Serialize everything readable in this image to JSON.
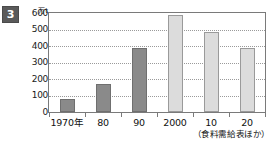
{
  "badge": {
    "number": "3"
  },
  "chart_data": {
    "type": "bar",
    "title": "",
    "subtitle": "",
    "xlabel": "",
    "ylabel": "万t",
    "unit_label": "万t",
    "categories": [
      "1970年",
      "80",
      "90",
      "2000",
      "10",
      "20"
    ],
    "values": [
      80,
      170,
      385,
      590,
      485,
      390
    ],
    "series": [
      {
        "name": "生産量",
        "values": [
          80,
          170,
          385,
          590,
          485,
          390
        ],
        "bar_styles": [
          "dark",
          "dark",
          "dark",
          "light",
          "light",
          "light"
        ]
      }
    ],
    "ylim": [
      0,
      600
    ],
    "ytick_values": [
      0,
      100,
      200,
      300,
      400,
      500,
      600
    ],
    "ytick_labels": [
      "0",
      "100",
      "200",
      "300",
      "400",
      "500",
      "600"
    ],
    "grid": true,
    "grid_style": "dotted-horizontal",
    "legend": false,
    "legend_position": "none",
    "source_note": "（食料需給表ほか）",
    "colors": {
      "bar_dark_fill": "#8a8a8a",
      "bar_dark_border": "#6f6f6f",
      "bar_light_fill": "#dcdcdc",
      "bar_light_border": "#9a9a9a",
      "axis": "#7a7a7a",
      "gridline": "#9a9a9a",
      "text": "#111111",
      "badge_bg": "#5a5a5a",
      "badge_text": "#ffffff",
      "background": "#ffffff"
    }
  }
}
